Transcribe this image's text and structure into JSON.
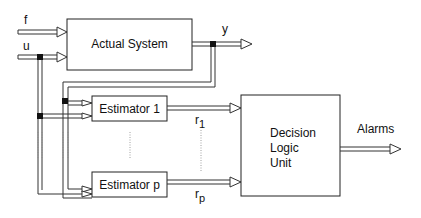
{
  "diagram": {
    "inputs": {
      "fault_label": "f",
      "input_label": "u"
    },
    "output_label": "y",
    "blocks": {
      "actual_system": "Actual System",
      "estimator_1": "Estimator 1",
      "estimator_p": "Estimator p",
      "decision_line1": "Decision",
      "decision_line2": "Logic",
      "decision_line3": "Unit"
    },
    "residuals": {
      "r1_base": "r",
      "r1_sub": "1",
      "rp_base": "r",
      "rp_sub": "p"
    },
    "alarms_label": "Alarms",
    "colors": {
      "line": "#333333",
      "junction": "#111111",
      "background": "#ffffff"
    }
  }
}
